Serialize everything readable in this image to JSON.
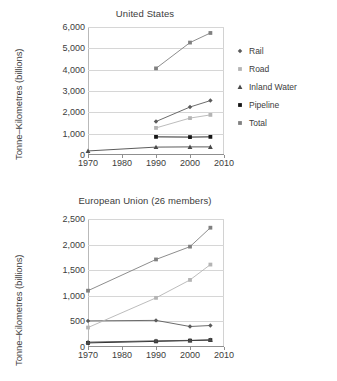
{
  "series_meta": [
    {
      "key": "rail",
      "label": "Rail",
      "marker": "diamond",
      "color": "#5b5b5b"
    },
    {
      "key": "road",
      "label": "Road",
      "marker": "square",
      "color": "#b4b4b4"
    },
    {
      "key": "inland",
      "label": "Inland Water",
      "marker": "triangle",
      "color": "#4a4a4a"
    },
    {
      "key": "pipe",
      "label": "Pipeline",
      "marker": "square",
      "color": "#151515"
    },
    {
      "key": "total",
      "label": "Total",
      "marker": "square",
      "color": "#808080"
    }
  ],
  "chart_data": [
    {
      "id": "united-states",
      "type": "line",
      "title": "United States",
      "xlabel": "",
      "ylabel": "Tonne–Kilometres (billions)",
      "x": [
        1970,
        1990,
        2000,
        2006
      ],
      "xlim": [
        1970,
        2010
      ],
      "xticks": [
        1970,
        1980,
        1990,
        2000,
        2010
      ],
      "xticklabels": [
        "1970",
        "1980",
        "1990",
        "2000",
        "2010"
      ],
      "ylim": [
        0,
        6000
      ],
      "yticks": [
        0,
        1000,
        2000,
        3000,
        4000,
        5000,
        6000
      ],
      "yticklabels": [
        "0",
        "1,000",
        "2,000",
        "3,000",
        "4,000",
        "5,000",
        "6,000"
      ],
      "grid": true,
      "legend_position": "right",
      "series": [
        {
          "name": "Rail",
          "x": [
            1990,
            2000,
            2006
          ],
          "values": [
            1570,
            2250,
            2550
          ]
        },
        {
          "name": "Road",
          "x": [
            1990,
            2000,
            2006
          ],
          "values": [
            1270,
            1730,
            1880
          ]
        },
        {
          "name": "Inland Water",
          "x": [
            1970,
            1990,
            2000,
            2006
          ],
          "values": [
            190,
            370,
            380,
            380
          ]
        },
        {
          "name": "Pipeline",
          "x": [
            1990,
            2000,
            2006
          ],
          "values": [
            850,
            840,
            850
          ]
        },
        {
          "name": "Total",
          "x": [
            1990,
            2000,
            2006
          ],
          "values": [
            4060,
            5270,
            5720
          ]
        }
      ]
    },
    {
      "id": "european-union",
      "type": "line",
      "title": "European Union (26 members)",
      "xlabel": "",
      "ylabel": "Tonne–Kilometres (billions)",
      "x": [
        1970,
        1990,
        2000,
        2006
      ],
      "xlim": [
        1970,
        2010
      ],
      "xticks": [
        1970,
        1980,
        1990,
        2000,
        2010
      ],
      "xticklabels": [
        "1970",
        "1980",
        "1990",
        "2000",
        "2010"
      ],
      "ylim": [
        0,
        2500
      ],
      "yticks": [
        0,
        500,
        1000,
        1500,
        2000,
        2500
      ],
      "yticklabels": [
        "0",
        "500",
        "1,000",
        "1,500",
        "2,000",
        "2,500"
      ],
      "grid": true,
      "legend_position": "right",
      "series": [
        {
          "name": "Rail",
          "x": [
            1970,
            1990,
            2000,
            2006
          ],
          "values": [
            510,
            520,
            400,
            420
          ]
        },
        {
          "name": "Road",
          "x": [
            1970,
            1990,
            2000,
            2006
          ],
          "values": [
            380,
            960,
            1310,
            1610
          ]
        },
        {
          "name": "Inland Water",
          "x": [
            1970,
            1990,
            2000,
            2006
          ],
          "values": [
            95,
            120,
            130,
            140
          ]
        },
        {
          "name": "Pipeline",
          "x": [
            1970,
            1990,
            2000,
            2006
          ],
          "values": [
            80,
            110,
            125,
            135
          ]
        },
        {
          "name": "Total",
          "x": [
            1970,
            1990,
            2000,
            2006
          ],
          "values": [
            1100,
            1710,
            1960,
            2330
          ]
        }
      ]
    }
  ]
}
